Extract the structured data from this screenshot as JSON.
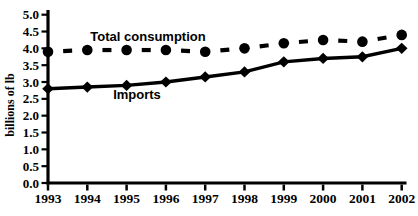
{
  "chart": {
    "background": "#ffffff",
    "ink": "#000000"
  },
  "chart_data": {
    "type": "line",
    "x": [
      "1993",
      "1994",
      "1995",
      "1996",
      "1997",
      "1998",
      "1999",
      "2000",
      "2001",
      "2002"
    ],
    "xlabel": "",
    "ylabel": "billions of lb",
    "ylim": [
      0.0,
      5.0
    ],
    "ytick_step": 0.5,
    "ytick_decimals": 1,
    "grid": false,
    "legend_position": "inline-labels",
    "series": [
      {
        "name": "Total consumption",
        "marker": "circle",
        "line_style": "dashed",
        "color": "#000000",
        "values": [
          3.9,
          3.95,
          3.95,
          3.95,
          3.9,
          4.0,
          4.15,
          4.25,
          4.2,
          4.4
        ]
      },
      {
        "name": "Imports",
        "marker": "diamond",
        "line_style": "solid",
        "color": "#000000",
        "values": [
          2.8,
          2.85,
          2.9,
          3.0,
          3.15,
          3.3,
          3.6,
          3.7,
          3.75,
          4.0
        ]
      }
    ]
  }
}
